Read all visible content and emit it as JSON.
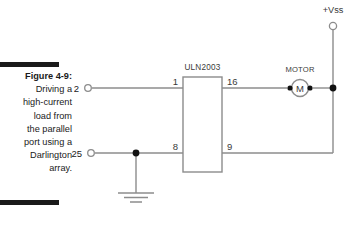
{
  "figure": {
    "label": "Figure 4-9:",
    "caption_lines": [
      "Driving a",
      "high-current",
      "load from",
      "the parallel",
      "port using a",
      "Darlington",
      "array."
    ],
    "rule_color": "#1a1a1a"
  },
  "schematic": {
    "ic": {
      "name": "ULN2003",
      "pins": {
        "top_left": "1",
        "top_right": "16",
        "bottom_left": "8",
        "bottom_right": "9"
      }
    },
    "port_terminals": [
      {
        "name": "parallel-port-pin-2",
        "number": "2"
      },
      {
        "name": "parallel-port-pin-25",
        "number": "25"
      }
    ],
    "supply": {
      "label": "+Vss",
      "terminal": "open-circle"
    },
    "load": {
      "label": "MOTOR",
      "symbol_letter": "M"
    },
    "ground": {
      "symbol": "earth-ground",
      "bars": 3
    },
    "colors": {
      "wire": "#8c8c8c",
      "junction": "#111111",
      "text": "#3a3a3a",
      "background": "#ffffff"
    }
  }
}
